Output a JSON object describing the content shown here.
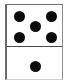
{
  "image": {
    "kind": "domino-tile",
    "description": "Domino tile showing five pips on the upper half and one pip on the lower half",
    "width": 73,
    "height": 83
  },
  "domino": {
    "value_label": "5-1",
    "total_pips": 6,
    "background_color": "#ffffff",
    "pip_color": "#0b0b0b",
    "border_color": "#6a6a6a",
    "divider_color": "#4a4a4a",
    "halves": [
      {
        "name": "top-half",
        "pip_count": 5,
        "arrangement": "quincunx",
        "pips": [
          {
            "name": "pip-top-left",
            "x": 7,
            "y": 6
          },
          {
            "name": "pip-top-right",
            "x": 39,
            "y": 6
          },
          {
            "name": "pip-center",
            "x": 23,
            "y": 16
          },
          {
            "name": "pip-bottom-left",
            "x": 7,
            "y": 27
          },
          {
            "name": "pip-bottom-right",
            "x": 39,
            "y": 27
          }
        ]
      },
      {
        "name": "bottom-half",
        "pip_count": 1,
        "arrangement": "center",
        "pips": [
          {
            "name": "pip-center",
            "x": 23,
            "y": 14
          }
        ]
      }
    ]
  }
}
